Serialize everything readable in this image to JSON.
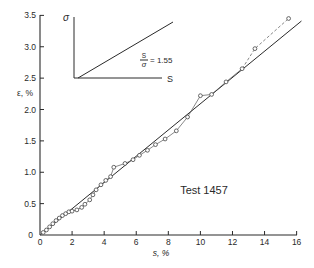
{
  "chart_data": {
    "type": "scatter",
    "title": "",
    "annotation": "Test 1457",
    "xlabel": "s, %",
    "ylabel": "ε, %",
    "xlim": [
      0,
      16
    ],
    "ylim": [
      0,
      3.5
    ],
    "grid": false,
    "legend": "none",
    "xticks": [
      0,
      2,
      4,
      6,
      8,
      10,
      12,
      14,
      16
    ],
    "xtick_labels": [
      "0",
      "2",
      "4",
      "6",
      "8",
      "10",
      "12",
      "14",
      "16"
    ],
    "yticks": [
      0,
      0.5,
      1.0,
      1.5,
      2.0,
      2.5,
      3.0,
      3.5
    ],
    "ytick_labels": [
      "0",
      "0.5",
      "1.0",
      "1.5",
      "2.0",
      "2.5",
      "3.0",
      "3.5"
    ],
    "connector_dashed_after_x": 12.6,
    "series": [
      {
        "name": "measured",
        "marker": "open-circle",
        "x": [
          0.2,
          0.4,
          0.6,
          0.8,
          1.0,
          1.2,
          1.4,
          1.6,
          1.8,
          2.0,
          2.3,
          2.6,
          2.8,
          3.1,
          3.3,
          3.5,
          3.8,
          4.1,
          4.4,
          4.6,
          5.3,
          5.8,
          6.2,
          6.7,
          7.2,
          7.8,
          8.5,
          9.2,
          10.0,
          10.7,
          11.6,
          12.6,
          13.4,
          15.5
        ],
        "y": [
          0.04,
          0.08,
          0.13,
          0.18,
          0.23,
          0.27,
          0.31,
          0.34,
          0.37,
          0.38,
          0.4,
          0.44,
          0.49,
          0.56,
          0.64,
          0.72,
          0.8,
          0.87,
          0.93,
          1.08,
          1.14,
          1.2,
          1.27,
          1.35,
          1.44,
          1.53,
          1.66,
          1.88,
          2.22,
          2.24,
          2.44,
          2.65,
          2.97,
          3.45
        ]
      },
      {
        "name": "linear fit",
        "marker": "none",
        "x": [
          0,
          16.3
        ],
        "y": [
          0,
          3.41
        ]
      }
    ],
    "inset": {
      "y_axis_label": "σ",
      "x_axis_label": "S",
      "ratio_numerator": "S",
      "ratio_denominator": "σ",
      "ratio_value": "= 1.55"
    }
  }
}
